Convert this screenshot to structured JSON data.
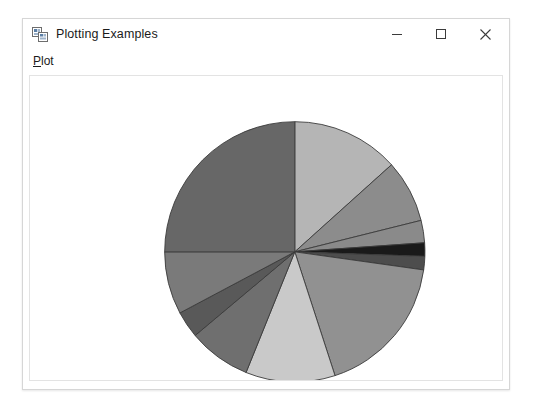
{
  "window": {
    "title": "Plotting Examples",
    "icon": "windows-forms-app-icon",
    "controls": {
      "minimize": "–",
      "maximize": "□",
      "close": "✕"
    }
  },
  "menu": {
    "items": [
      {
        "label": "Plot",
        "mnemonic": "P",
        "rest": "lot"
      }
    ]
  },
  "chart_data": {
    "type": "pie",
    "title": "",
    "xlabel": "",
    "ylabel": "",
    "legend": "none",
    "grid": false,
    "center": {
      "cx": 266,
      "cy": 177
    },
    "radius": 131,
    "start_angle_deg": -90,
    "direction": "clockwise",
    "stroke": "#3a3a3a",
    "stroke_width": 0.9,
    "categories": [
      "Slice 1",
      "Slice 2",
      "Slice 3",
      "Slice 4",
      "Slice 5",
      "Slice 6",
      "Slice 7",
      "Slice 8",
      "Slice 9",
      "Slice 10",
      "Slice 11"
    ],
    "values": [
      13.3,
      7.8,
      2.8,
      1.7,
      1.7,
      17.8,
      11.1,
      7.8,
      3.3,
      7.8,
      25.0
    ],
    "colors": [
      "#b5b5b5",
      "#8c8c8c",
      "#8a8a8a",
      "#1a1a1a",
      "#4d4d4d",
      "#919191",
      "#c9c9c9",
      "#6f6f6f",
      "#595959",
      "#7a7a7a",
      "#676767"
    ],
    "slices": [
      {
        "label": "Slice 1",
        "start_deg": -90.0,
        "end_deg": -42.0,
        "value": 13.3,
        "color": "#b5b5b5"
      },
      {
        "label": "Slice 2",
        "start_deg": -42.0,
        "end_deg": -14.0,
        "value": 7.8,
        "color": "#8c8c8c"
      },
      {
        "label": "Slice 3",
        "start_deg": -14.0,
        "end_deg": -4.0,
        "value": 2.8,
        "color": "#8a8a8a"
      },
      {
        "label": "Slice 4",
        "start_deg": -4.0,
        "end_deg": 2.0,
        "value": 1.7,
        "color": "#1a1a1a"
      },
      {
        "label": "Slice 5",
        "start_deg": 2.0,
        "end_deg": 8.0,
        "value": 1.7,
        "color": "#4d4d4d"
      },
      {
        "label": "Slice 6",
        "start_deg": 8.0,
        "end_deg": 72.0,
        "value": 17.8,
        "color": "#919191"
      },
      {
        "label": "Slice 7",
        "start_deg": 72.0,
        "end_deg": 112.0,
        "value": 11.1,
        "color": "#c9c9c9"
      },
      {
        "label": "Slice 8",
        "start_deg": 112.0,
        "end_deg": 140.0,
        "value": 7.8,
        "color": "#6f6f6f"
      },
      {
        "label": "Slice 9",
        "start_deg": 140.0,
        "end_deg": 152.0,
        "value": 3.3,
        "color": "#595959"
      },
      {
        "label": "Slice 10",
        "start_deg": 152.0,
        "end_deg": 180.0,
        "value": 7.8,
        "color": "#7a7a7a"
      },
      {
        "label": "Slice 11",
        "start_deg": 180.0,
        "end_deg": 270.0,
        "value": 25.0,
        "color": "#676767"
      }
    ]
  }
}
